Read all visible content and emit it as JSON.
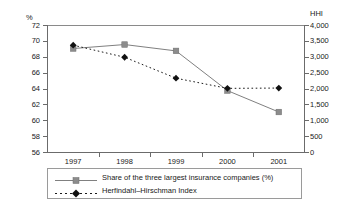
{
  "chart_data": {
    "type": "line",
    "title": "",
    "subtitle": "",
    "xlabel": "",
    "ylabel": "%",
    "y2label": "HHI",
    "categories": [
      "1997",
      "1998",
      "1999",
      "2000",
      "2001"
    ],
    "x": [
      1997,
      1998,
      1999,
      2000,
      2001
    ],
    "ylim": [
      56,
      72
    ],
    "y2lim": [
      0,
      4000
    ],
    "ytick_step": 2,
    "y2tick_step": 500,
    "grid": false,
    "legend_position": "bottom",
    "yticks": [
      "56",
      "58",
      "60",
      "62",
      "64",
      "66",
      "68",
      "70",
      "72"
    ],
    "y2ticks": [
      "0",
      "500",
      "1,000",
      "1,500",
      "2,000",
      "2,500",
      "3,000",
      "3,500",
      "4,000"
    ],
    "series": [
      {
        "name": "Share of the three largest insurance companies (%)",
        "axis": "left",
        "marker": "square",
        "line_style": "solid",
        "color": "#808080",
        "marker_color": "#8c8c8c",
        "values": [
          69.1,
          69.6,
          68.8,
          63.8,
          61.1
        ]
      },
      {
        "name": "Herfindahl–Hirschman Index",
        "axis": "right",
        "marker": "diamond",
        "line_style": "dotted",
        "color": "#1a1a1a",
        "marker_color": "#111111",
        "values": [
          3380,
          3000,
          2340,
          2020,
          2030
        ]
      }
    ]
  },
  "axes": {
    "left_unit": "%",
    "right_unit": "HHI"
  },
  "legend": {
    "items": [
      {
        "label": "Share of the three largest insurance companies (%)"
      },
      {
        "label": "Herfindahl–Hirschman Index"
      }
    ]
  },
  "colors": {
    "share_line": "#808080",
    "hhi_line": "#1a1a1a",
    "axis": "#6b6b6b",
    "text": "#1a1a1a",
    "background": "#ffffff"
  }
}
